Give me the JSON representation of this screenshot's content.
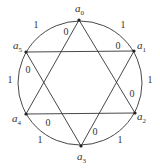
{
  "diagram": {
    "vertices": [
      {
        "id": "a0",
        "name": "a",
        "sub": "0"
      },
      {
        "id": "a1",
        "name": "a",
        "sub": "1"
      },
      {
        "id": "a2",
        "name": "a",
        "sub": "2"
      },
      {
        "id": "a3",
        "name": "a",
        "sub": "3"
      },
      {
        "id": "a4",
        "name": "a",
        "sub": "4"
      },
      {
        "id": "a5",
        "name": "a",
        "sub": "5"
      }
    ],
    "arc_edges": [
      {
        "from": "a0",
        "to": "a1",
        "label": "1"
      },
      {
        "from": "a1",
        "to": "a2",
        "label": "1"
      },
      {
        "from": "a2",
        "to": "a3",
        "label": "1"
      },
      {
        "from": "a3",
        "to": "a4",
        "label": "1"
      },
      {
        "from": "a4",
        "to": "a5",
        "label": "1"
      },
      {
        "from": "a5",
        "to": "a0",
        "label": "1"
      }
    ],
    "chord_edges": [
      {
        "from": "a0",
        "to": "a4",
        "label": "0"
      },
      {
        "from": "a5",
        "to": "a1",
        "label": "0"
      },
      {
        "from": "a5",
        "to": "a3",
        "label": "0"
      },
      {
        "from": "a0",
        "to": "a2",
        "label": "0"
      },
      {
        "from": "a4",
        "to": "a2",
        "label": "0"
      },
      {
        "from": "a1",
        "to": "a3",
        "label": "0"
      }
    ]
  }
}
